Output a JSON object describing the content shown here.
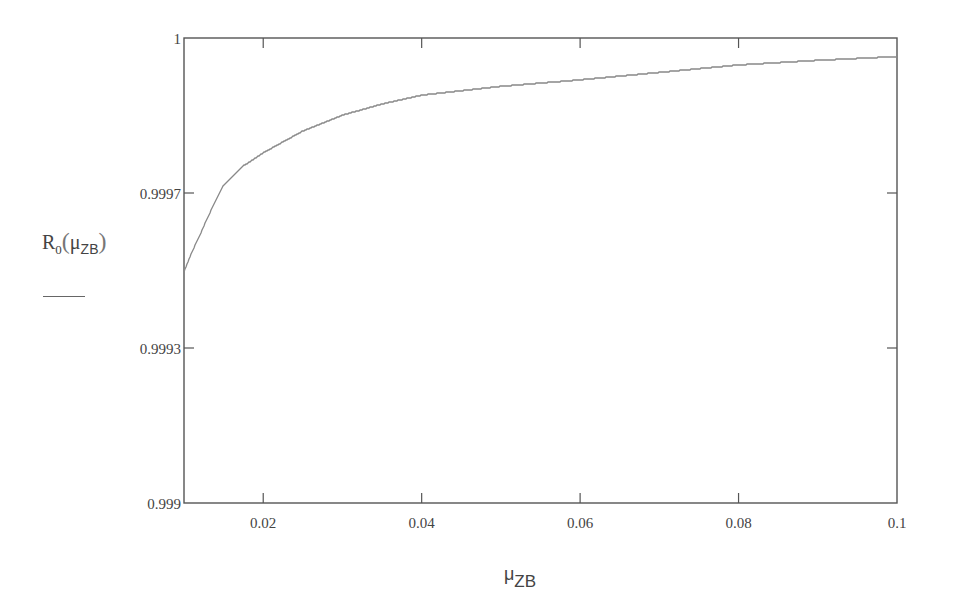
{
  "chart_data": {
    "type": "line",
    "title": "",
    "xlabel": "μZB",
    "ylabel": "R0(μZB)",
    "xlim": [
      0.01,
      0.1
    ],
    "ylim": [
      0.999,
      1
    ],
    "grid": false,
    "legend": null,
    "x_ticks": [
      0.02,
      0.04,
      0.06,
      0.08,
      0.1
    ],
    "x_tick_labels": [
      "0.02",
      "0.04",
      "0.06",
      "0.08",
      "0.1"
    ],
    "y_tick_labels": [
      "1",
      "0.9997",
      "0.9993",
      "0.999"
    ],
    "series": [
      {
        "name": "R0(μZB)",
        "x": [
          0.01,
          0.011,
          0.012,
          0.013,
          0.015,
          0.0175,
          0.02,
          0.025,
          0.03,
          0.035,
          0.04,
          0.05,
          0.06,
          0.07,
          0.08,
          0.09,
          0.1
        ],
        "y": [
          0.999497,
          0.99954,
          0.999576,
          0.999615,
          0.999684,
          0.999725,
          0.999753,
          0.9998,
          0.999834,
          0.999858,
          0.999877,
          0.999896,
          0.99991,
          0.999926,
          0.999942,
          0.999952,
          0.99996
        ]
      }
    ]
  },
  "labels": {
    "y_axis": {
      "main": "R",
      "sub0": "0",
      "open": "(",
      "mu": "μ",
      "mu_sub": "ZB",
      "close": ")"
    },
    "x_axis": {
      "mu": "μ",
      "mu_sub": "ZB"
    }
  },
  "colors": {
    "axis": "#555555",
    "curve": "#888888",
    "background": "#ffffff"
  }
}
